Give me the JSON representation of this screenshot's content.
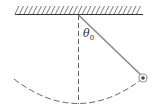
{
  "figure": {
    "type": "pendulum",
    "angle_label": "θ",
    "angle_subscript": "0",
    "colors": {
      "line": "#333333",
      "string": "#8a8a8a",
      "dashed": "#555555",
      "bob_outer": "#999999",
      "bob_inner": "#444444"
    }
  }
}
